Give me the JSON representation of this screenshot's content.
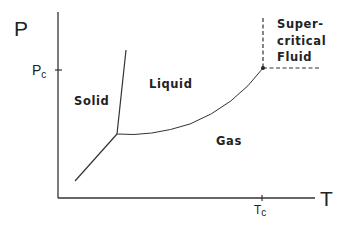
{
  "diagram": {
    "type": "phase-diagram",
    "axes": {
      "y_label": "P",
      "x_label": "T",
      "y_tick": {
        "main": "P",
        "sub": "c"
      },
      "x_tick": {
        "main": "T",
        "sub": "c"
      }
    },
    "regions": {
      "solid": "Solid",
      "liquid": "Liquid",
      "gas": "Gas",
      "supercritical_line1": "Super-",
      "supercritical_line2": "critical",
      "supercritical_line3": "Fluid"
    },
    "points": {
      "triple_point": [
        117,
        134
      ],
      "critical_point": [
        263,
        68
      ]
    },
    "colors": {
      "line": "#333333",
      "text": "#222222",
      "background": "#ffffff"
    }
  }
}
